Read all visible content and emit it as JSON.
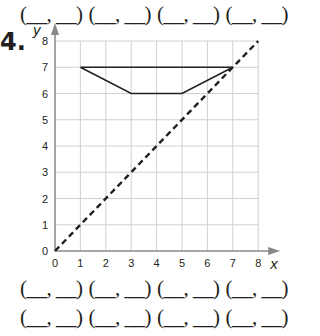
{
  "top_answers": {
    "pairs": [
      "(__, __)",
      "(__, __)",
      "(__, __)",
      "(__, __)"
    ]
  },
  "problem": {
    "number": "4."
  },
  "graph": {
    "x_label": "x",
    "y_label": "y",
    "x_ticks": [
      "0",
      "1",
      "2",
      "3",
      "4",
      "5",
      "6",
      "7",
      "8"
    ],
    "y_ticks": [
      "0",
      "1",
      "2",
      "3",
      "4",
      "5",
      "6",
      "7",
      "8"
    ],
    "grid_color": "#d0d0d0",
    "axis_color": "#888888",
    "line_color": "#231f20"
  },
  "bottom_answers": {
    "row1": [
      "(__, __)",
      "(__, __)",
      "(__, __)",
      "(__, __)"
    ],
    "row2": [
      "(__, __)",
      "(__, __)",
      "(__, __)",
      "(__, __)"
    ]
  },
  "chart_data": {
    "type": "line",
    "title": "",
    "xlabel": "x",
    "ylabel": "y",
    "xlim": [
      0,
      8
    ],
    "ylim": [
      0,
      8
    ],
    "grid": true,
    "series": [
      {
        "name": "quadrilateral",
        "style": "solid",
        "points": [
          [
            1,
            7
          ],
          [
            7,
            7
          ],
          [
            5,
            6
          ],
          [
            3,
            6
          ],
          [
            1,
            7
          ]
        ]
      },
      {
        "name": "line y = x",
        "style": "dashed",
        "points": [
          [
            0,
            0
          ],
          [
            8,
            8
          ]
        ]
      }
    ]
  }
}
